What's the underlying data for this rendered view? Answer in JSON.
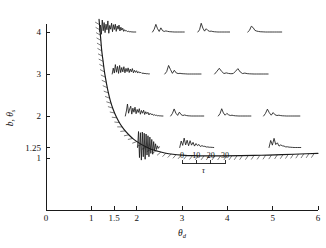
{
  "chart_data": {
    "type": "line",
    "title": "",
    "xlabel": "θ_d",
    "xlabel_base": "θ",
    "xlabel_sub": "d",
    "ylabel": "b, θ_s",
    "ylabel_base": "b, θ",
    "ylabel_sub": "s",
    "xlim": [
      0,
      6
    ],
    "ylim": [
      0.55,
      4.35
    ],
    "grid": false,
    "legend": "none",
    "x_ticks": [
      {
        "value": 0,
        "label": "0"
      },
      {
        "value": 1,
        "label": "1"
      },
      {
        "value": 1.5,
        "label": "1.5"
      },
      {
        "value": 2,
        "label": "2"
      },
      {
        "value": 3,
        "label": "3"
      },
      {
        "value": 4,
        "label": "4"
      },
      {
        "value": 5,
        "label": "5"
      },
      {
        "value": 6,
        "label": "6"
      }
    ],
    "y_ticks": [
      {
        "value": 1,
        "label": "1"
      },
      {
        "value": 1.25,
        "label": "1.25"
      },
      {
        "value": 2,
        "label": "2"
      },
      {
        "value": 3,
        "label": "3"
      },
      {
        "value": 4,
        "label": "4"
      }
    ],
    "series": [
      {
        "name": "stability-boundary",
        "type": "line",
        "hatched_side": "inner",
        "points": [
          [
            1.17,
            4.3
          ],
          [
            1.19,
            4.05
          ],
          [
            1.21,
            3.8
          ],
          [
            1.23,
            3.55
          ],
          [
            1.26,
            3.3
          ],
          [
            1.29,
            3.05
          ],
          [
            1.33,
            2.8
          ],
          [
            1.37,
            2.58
          ],
          [
            1.42,
            2.36
          ],
          [
            1.48,
            2.16
          ],
          [
            1.55,
            1.98
          ],
          [
            1.63,
            1.82
          ],
          [
            1.72,
            1.68
          ],
          [
            1.82,
            1.56
          ],
          [
            1.93,
            1.45
          ],
          [
            2.05,
            1.36
          ],
          [
            2.18,
            1.28
          ],
          [
            2.32,
            1.21
          ],
          [
            2.47,
            1.16
          ],
          [
            2.62,
            1.12
          ],
          [
            2.8,
            1.09
          ],
          [
            3.0,
            1.07
          ],
          [
            3.25,
            1.055
          ],
          [
            3.55,
            1.05
          ],
          [
            3.9,
            1.05
          ],
          [
            4.3,
            1.055
          ],
          [
            4.75,
            1.065
          ],
          [
            5.2,
            1.08
          ],
          [
            5.6,
            1.095
          ],
          [
            6.0,
            1.11
          ]
        ]
      }
    ],
    "inset_scale": {
      "ticks": [
        {
          "value": 0,
          "label": "0"
        },
        {
          "value": 10,
          "label": "10"
        },
        {
          "value": 20,
          "label": "20"
        },
        {
          "value": 30,
          "label": "30"
        }
      ],
      "label": "τ",
      "x_start": 3.0,
      "x_end": 3.95,
      "y_level": 0.86
    },
    "waveform_insets": [
      {
        "row_label": "4",
        "baseline": 4.0,
        "traces": [
          {
            "x_start": 1.18,
            "x_end": 1.98,
            "amplitude": 0.3,
            "samples": [
              0.05,
              0.55,
              -0.18,
              0.95,
              0.1,
              0.75,
              -0.05,
              0.62,
              0.18,
              0.88,
              -0.1,
              0.52,
              0.22,
              0.7,
              0.02,
              0.58,
              0.2,
              0.62,
              0.05,
              0.48,
              0.22,
              0.55,
              0.08,
              0.38,
              0.15,
              0.3,
              0.05,
              0.18,
              0.08,
              0.1,
              0.04,
              0.06,
              0.02,
              0.03,
              0.01,
              0.01,
              0.0,
              0.0,
              0.0,
              0.0
            ]
          },
          {
            "x_start": 2.35,
            "x_end": 3.05,
            "amplitude": 0.26,
            "samples": [
              0.0,
              0.25,
              0.7,
              0.3,
              0.05,
              0.38,
              0.12,
              0.05,
              0.1,
              0.06,
              0.03,
              0.02,
              0.01,
              0.0,
              0.0,
              0.0,
              0.0,
              0.0,
              0.0,
              0.0
            ]
          },
          {
            "x_start": 3.35,
            "x_end": 4.05,
            "amplitude": 0.26,
            "samples": [
              0.0,
              0.2,
              0.8,
              0.35,
              0.08,
              0.3,
              0.14,
              0.06,
              0.08,
              0.04,
              0.02,
              0.01,
              0.0,
              0.0,
              0.0,
              0.0,
              0.0,
              0.0,
              0.0,
              0.0
            ]
          },
          {
            "x_start": 4.45,
            "x_end": 5.2,
            "amplitude": 0.22,
            "samples": [
              0.0,
              0.18,
              0.62,
              0.48,
              0.18,
              0.1,
              0.06,
              0.03,
              0.02,
              0.01,
              0.0,
              0.0,
              0.0,
              0.0,
              0.0,
              0.0,
              0.0,
              0.0,
              0.0,
              0.0
            ]
          }
        ]
      },
      {
        "row_label": "3",
        "baseline": 3.0,
        "traces": [
          {
            "x_start": 1.46,
            "x_end": 2.28,
            "amplitude": 0.28,
            "samples": [
              0.0,
              0.5,
              0.08,
              0.8,
              0.15,
              0.65,
              0.05,
              0.72,
              0.12,
              0.55,
              0.18,
              0.62,
              0.1,
              0.48,
              0.2,
              0.52,
              0.12,
              0.42,
              0.18,
              0.46,
              0.1,
              0.32,
              0.14,
              0.28,
              0.08,
              0.2,
              0.1,
              0.14,
              0.05,
              0.08,
              0.04,
              0.05,
              0.02,
              0.03,
              0.01,
              0.01
            ]
          },
          {
            "x_start": 2.62,
            "x_end": 3.42,
            "amplitude": 0.26,
            "samples": [
              0.0,
              0.22,
              0.78,
              0.4,
              0.06,
              0.34,
              0.1,
              0.04,
              0.06,
              0.03,
              0.02,
              0.01,
              0.0,
              0.0,
              0.0,
              0.0,
              0.0,
              0.0,
              0.0,
              0.0
            ]
          },
          {
            "x_start": 3.72,
            "x_end": 4.9,
            "amplitude": 0.22,
            "samples": [
              0.0,
              0.3,
              0.62,
              0.28,
              0.05,
              0.12,
              0.06,
              0.03,
              0.05,
              0.3,
              0.58,
              0.22,
              0.05,
              0.1,
              0.04,
              0.02,
              0.01,
              0.0,
              0.0,
              0.0,
              0.0,
              0.0,
              0.0,
              0.0
            ]
          }
        ]
      },
      {
        "row_label": "2",
        "baseline": 2.0,
        "traces": [
          {
            "x_start": 1.75,
            "x_end": 2.58,
            "amplitude": 0.3,
            "samples": [
              0.0,
              0.4,
              0.95,
              0.22,
              0.55,
              0.78,
              0.15,
              0.62,
              0.3,
              0.7,
              0.18,
              0.52,
              0.28,
              0.58,
              0.14,
              0.44,
              0.22,
              0.46,
              0.12,
              0.34,
              0.18,
              0.3,
              0.08,
              0.22,
              0.12,
              0.16,
              0.06,
              0.1,
              0.05,
              0.06,
              0.02,
              0.03,
              0.01,
              0.01,
              0.0,
              0.0
            ]
          },
          {
            "x_start": 2.75,
            "x_end": 3.48,
            "amplitude": 0.24,
            "samples": [
              0.0,
              0.25,
              0.7,
              0.28,
              0.06,
              0.38,
              0.14,
              0.05,
              0.1,
              0.05,
              0.02,
              0.01,
              0.0,
              0.0,
              0.0,
              0.0,
              0.0,
              0.0,
              0.0,
              0.0
            ]
          },
          {
            "x_start": 3.8,
            "x_end": 4.52,
            "amplitude": 0.24,
            "samples": [
              0.0,
              0.22,
              0.72,
              0.3,
              0.08,
              0.26,
              0.12,
              0.05,
              0.08,
              0.04,
              0.02,
              0.01,
              0.0,
              0.0,
              0.0,
              0.0,
              0.0,
              0.0,
              0.0,
              0.0
            ]
          },
          {
            "x_start": 4.8,
            "x_end": 5.6,
            "amplitude": 0.24,
            "samples": [
              0.0,
              0.26,
              0.68,
              0.32,
              0.08,
              0.34,
              0.12,
              0.05,
              0.08,
              0.04,
              0.02,
              0.01,
              0.0,
              0.0,
              0.0,
              0.0,
              0.0,
              0.0,
              0.0,
              0.0
            ]
          }
        ]
      },
      {
        "row_label": "1.25",
        "baseline": 1.25,
        "traces": [
          {
            "x_start": 2.02,
            "x_end": 2.5,
            "amplitude": 0.4,
            "samples": [
              0.0,
              0.95,
              -0.6,
              0.88,
              -0.75,
              0.92,
              -0.55,
              0.85,
              -0.7,
              0.8,
              -0.45,
              0.7,
              -0.55,
              0.62,
              -0.35,
              0.48,
              -0.4,
              0.35,
              -0.2,
              0.22,
              -0.12,
              0.1,
              -0.05,
              0.04
            ]
          },
          {
            "x_start": 2.95,
            "x_end": 3.7,
            "amplitude": 0.28,
            "samples": [
              0.0,
              0.55,
              0.18,
              0.8,
              0.22,
              0.62,
              0.15,
              0.58,
              0.2,
              0.44,
              0.12,
              0.34,
              0.16,
              0.26,
              0.08,
              0.16,
              0.1,
              0.1,
              0.04,
              0.05,
              0.02,
              0.02,
              0.01,
              0.0
            ]
          },
          {
            "x_start": 4.92,
            "x_end": 5.62,
            "amplitude": 0.28,
            "samples": [
              0.0,
              0.6,
              0.2,
              0.78,
              0.25,
              0.4,
              0.12,
              0.22,
              0.14,
              0.12,
              0.05,
              0.06,
              0.03,
              0.02,
              0.01,
              0.0,
              0.0,
              0.0,
              0.0,
              0.0
            ]
          }
        ]
      }
    ]
  },
  "figure": {
    "background_color": "#ffffff",
    "line_color": "#1a1a1a",
    "hatch_color": "#444444"
  }
}
